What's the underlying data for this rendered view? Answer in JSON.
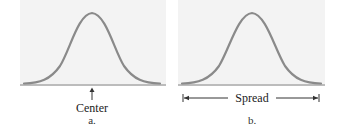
{
  "figure": {
    "panels": [
      {
        "id": "a",
        "sublabel": "a.",
        "annotation": "Center",
        "annotation_type": "arrow-up-to-peak-center",
        "curve": "normal-bell"
      },
      {
        "id": "b",
        "sublabel": "b.",
        "annotation": "Spread",
        "annotation_type": "double-arrow-span",
        "curve": "normal-bell"
      }
    ],
    "colors": {
      "curve": "#8a8a8a",
      "baseline": "#7a7a7a",
      "panel_bg": "#f3f3f3",
      "text": "#222222"
    }
  }
}
